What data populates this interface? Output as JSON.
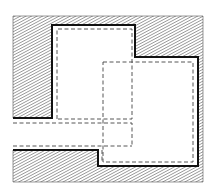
{
  "diagram": {
    "type": "architectural-plan",
    "colors": {
      "background": "#ffffff",
      "hatch": "#5a5a5a",
      "wall": "#111111",
      "dashed": "#444444"
    },
    "elements": [
      {
        "id": "hatched-wall-mass",
        "kind": "solid-wall",
        "pattern": "diagonal-hatch"
      },
      {
        "id": "upper-left-room",
        "kind": "room-outline",
        "style": "solid"
      },
      {
        "id": "lower-right-room",
        "kind": "room-outline",
        "style": "solid"
      },
      {
        "id": "upper-room-dashed",
        "kind": "inner-outline",
        "style": "dashed"
      },
      {
        "id": "lower-room-dashed",
        "kind": "inner-outline",
        "style": "dashed"
      },
      {
        "id": "corridor",
        "kind": "opening",
        "style": "dashed"
      }
    ]
  }
}
